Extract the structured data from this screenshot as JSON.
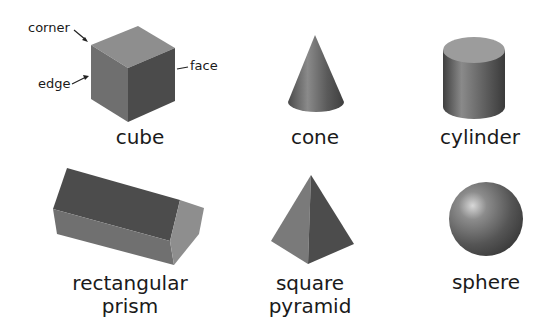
{
  "shapes": {
    "cube": {
      "label": "cube"
    },
    "cone": {
      "label": "cone"
    },
    "cylinder": {
      "label": "cylinder"
    },
    "rectangular_prism": {
      "label_line1": "rectangular",
      "label_line2": "prism"
    },
    "square_pyramid": {
      "label_line1": "square",
      "label_line2": "pyramid"
    },
    "sphere": {
      "label": "sphere"
    }
  },
  "annotations": {
    "corner": "corner",
    "edge": "edge",
    "face": "face"
  },
  "colors": {
    "background": "#ffffff",
    "text": "#1a1a1a",
    "light_face": "#8f8f8f",
    "mid_face": "#6e6e6e",
    "dark_face": "#4a4a4a"
  }
}
